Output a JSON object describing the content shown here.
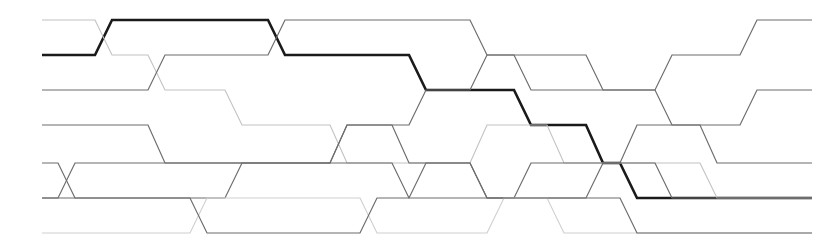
{
  "figure": {
    "name": "braid-diagram",
    "width": 827,
    "height": 250,
    "background_color": "#ffffff"
  },
  "geometry": {
    "lane_y": [
      20,
      55,
      90,
      125,
      163,
      198,
      233
    ],
    "lane_count": 7,
    "x_start": 42,
    "x_end": 812,
    "transition_width": 16,
    "note": "Strands run horizontally along lanes and cross diagonally between adjacent lanes."
  },
  "styles": {
    "thin_color": "#6d6d6d",
    "thin_faint_color": "#b9b9b9",
    "thin_pale_color": "#d8d8d8",
    "bold_color": "#1a1a1a",
    "thin_width": 1.2,
    "thin_faint_width": 1.1,
    "bold_width": 2.6
  },
  "strands": [
    {
      "id": "strand-bold-1",
      "label": "highlighted-strand",
      "emphasis": "bold",
      "color": "#1a1a1a",
      "stroke_width": 2.6,
      "path": [
        {
          "x": 42,
          "lane": 1
        },
        {
          "x": 95,
          "lane": 1
        },
        {
          "x": 112,
          "lane": 0
        },
        {
          "x": 268,
          "lane": 0
        },
        {
          "x": 285,
          "lane": 1
        },
        {
          "x": 409,
          "lane": 1
        },
        {
          "x": 426,
          "lane": 2
        },
        {
          "x": 514,
          "lane": 2
        },
        {
          "x": 531,
          "lane": 3
        },
        {
          "x": 586,
          "lane": 3
        },
        {
          "x": 603,
          "lane": 4
        },
        {
          "x": 620,
          "lane": 4
        },
        {
          "x": 637,
          "lane": 5
        },
        {
          "x": 812,
          "lane": 5
        }
      ]
    },
    {
      "id": "strand-2",
      "label": "strand-lane0-start",
      "emphasis": "faint",
      "color": "#c2c2c2",
      "stroke_width": 1.1,
      "path": [
        {
          "x": 42,
          "lane": 0
        },
        {
          "x": 95,
          "lane": 0
        },
        {
          "x": 112,
          "lane": 1
        },
        {
          "x": 148,
          "lane": 1
        },
        {
          "x": 165,
          "lane": 2
        },
        {
          "x": 225,
          "lane": 2
        },
        {
          "x": 242,
          "lane": 3
        },
        {
          "x": 330,
          "lane": 3
        },
        {
          "x": 347,
          "lane": 4
        },
        {
          "x": 470,
          "lane": 4
        },
        {
          "x": 487,
          "lane": 3
        },
        {
          "x": 547,
          "lane": 3
        },
        {
          "x": 564,
          "lane": 4
        },
        {
          "x": 700,
          "lane": 4
        },
        {
          "x": 717,
          "lane": 5
        },
        {
          "x": 812,
          "lane": 5
        }
      ]
    },
    {
      "id": "strand-3",
      "label": "strand-rising-midline",
      "emphasis": "normal",
      "color": "#6d6d6d",
      "stroke_width": 1.2,
      "path": [
        {
          "x": 42,
          "lane": 2
        },
        {
          "x": 148,
          "lane": 2
        },
        {
          "x": 165,
          "lane": 1
        },
        {
          "x": 268,
          "lane": 1
        },
        {
          "x": 285,
          "lane": 0
        },
        {
          "x": 470,
          "lane": 0
        },
        {
          "x": 487,
          "lane": 1
        },
        {
          "x": 514,
          "lane": 1
        },
        {
          "x": 531,
          "lane": 2
        },
        {
          "x": 655,
          "lane": 2
        },
        {
          "x": 672,
          "lane": 1
        },
        {
          "x": 740,
          "lane": 1
        },
        {
          "x": 757,
          "lane": 0
        },
        {
          "x": 812,
          "lane": 0
        }
      ]
    },
    {
      "id": "strand-4",
      "label": "strand-lane3-weave",
      "emphasis": "normal",
      "color": "#6d6d6d",
      "stroke_width": 1.2,
      "path": [
        {
          "x": 42,
          "lane": 3
        },
        {
          "x": 148,
          "lane": 3
        },
        {
          "x": 165,
          "lane": 4
        },
        {
          "x": 330,
          "lane": 4
        },
        {
          "x": 347,
          "lane": 3
        },
        {
          "x": 409,
          "lane": 3
        },
        {
          "x": 426,
          "lane": 2
        },
        {
          "x": 470,
          "lane": 2
        },
        {
          "x": 487,
          "lane": 1
        },
        {
          "x": 586,
          "lane": 1
        },
        {
          "x": 603,
          "lane": 2
        },
        {
          "x": 655,
          "lane": 2
        },
        {
          "x": 672,
          "lane": 3
        },
        {
          "x": 700,
          "lane": 3
        },
        {
          "x": 717,
          "lane": 4
        },
        {
          "x": 812,
          "lane": 4
        }
      ]
    },
    {
      "id": "strand-5",
      "label": "strand-lane4-crossover",
      "emphasis": "normal",
      "color": "#6d6d6d",
      "stroke_width": 1.2,
      "path": [
        {
          "x": 42,
          "lane": 4
        },
        {
          "x": 58,
          "lane": 4
        },
        {
          "x": 75,
          "lane": 5
        },
        {
          "x": 225,
          "lane": 5
        },
        {
          "x": 242,
          "lane": 4
        },
        {
          "x": 392,
          "lane": 4
        },
        {
          "x": 409,
          "lane": 5
        },
        {
          "x": 586,
          "lane": 5
        },
        {
          "x": 603,
          "lane": 4
        },
        {
          "x": 620,
          "lane": 4
        },
        {
          "x": 637,
          "lane": 3
        },
        {
          "x": 740,
          "lane": 3
        },
        {
          "x": 757,
          "lane": 2
        },
        {
          "x": 812,
          "lane": 2
        }
      ]
    },
    {
      "id": "strand-6",
      "label": "strand-lane5-crossover",
      "emphasis": "normal",
      "color": "#6d6d6d",
      "stroke_width": 1.2,
      "path": [
        {
          "x": 42,
          "lane": 5
        },
        {
          "x": 58,
          "lane": 5
        },
        {
          "x": 75,
          "lane": 4
        },
        {
          "x": 330,
          "lane": 4
        },
        {
          "x": 347,
          "lane": 3
        },
        {
          "x": 392,
          "lane": 3
        },
        {
          "x": 409,
          "lane": 4
        },
        {
          "x": 470,
          "lane": 4
        },
        {
          "x": 487,
          "lane": 5
        },
        {
          "x": 514,
          "lane": 5
        },
        {
          "x": 531,
          "lane": 4
        },
        {
          "x": 655,
          "lane": 4
        },
        {
          "x": 672,
          "lane": 5
        },
        {
          "x": 812,
          "lane": 5
        }
      ]
    },
    {
      "id": "strand-7",
      "label": "strand-bottom-lane",
      "emphasis": "pale",
      "color": "#cfcfcf",
      "stroke_width": 1.1,
      "path": [
        {
          "x": 42,
          "lane": 6
        },
        {
          "x": 190,
          "lane": 6
        },
        {
          "x": 207,
          "lane": 5
        },
        {
          "x": 360,
          "lane": 5
        },
        {
          "x": 377,
          "lane": 6
        },
        {
          "x": 487,
          "lane": 6
        },
        {
          "x": 504,
          "lane": 5
        },
        {
          "x": 547,
          "lane": 5
        },
        {
          "x": 564,
          "lane": 6
        },
        {
          "x": 812,
          "lane": 6
        }
      ]
    },
    {
      "id": "strand-8",
      "label": "strand-lower-weave",
      "emphasis": "normal",
      "color": "#6d6d6d",
      "stroke_width": 1.2,
      "path": [
        {
          "x": 42,
          "lane": 5
        },
        {
          "x": 190,
          "lane": 5
        },
        {
          "x": 207,
          "lane": 6
        },
        {
          "x": 360,
          "lane": 6
        },
        {
          "x": 377,
          "lane": 5
        },
        {
          "x": 409,
          "lane": 5
        },
        {
          "x": 426,
          "lane": 4
        },
        {
          "x": 470,
          "lane": 4
        },
        {
          "x": 487,
          "lane": 5
        },
        {
          "x": 620,
          "lane": 5
        },
        {
          "x": 637,
          "lane": 6
        },
        {
          "x": 812,
          "lane": 6
        }
      ]
    }
  ],
  "crossings": [
    {
      "x": 104,
      "lanes": [
        0,
        1
      ]
    },
    {
      "x": 157,
      "lanes": [
        1,
        2
      ]
    },
    {
      "x": 67,
      "lanes": [
        4,
        5
      ]
    },
    {
      "x": 199,
      "lanes": [
        5,
        6
      ]
    },
    {
      "x": 234,
      "lanes": [
        2,
        3
      ]
    },
    {
      "x": 277,
      "lanes": [
        0,
        1
      ]
    },
    {
      "x": 339,
      "lanes": [
        3,
        4
      ]
    },
    {
      "x": 369,
      "lanes": [
        5,
        6
      ]
    },
    {
      "x": 401,
      "lanes": [
        4,
        5
      ]
    },
    {
      "x": 418,
      "lanes": [
        1,
        2
      ]
    },
    {
      "x": 479,
      "lanes": [
        0,
        1
      ]
    },
    {
      "x": 523,
      "lanes": [
        2,
        3
      ]
    },
    {
      "x": 556,
      "lanes": [
        3,
        4
      ]
    },
    {
      "x": 595,
      "lanes": [
        3,
        4
      ]
    },
    {
      "x": 629,
      "lanes": [
        4,
        5
      ]
    },
    {
      "x": 664,
      "lanes": [
        1,
        2
      ]
    },
    {
      "x": 709,
      "lanes": [
        3,
        4
      ]
    },
    {
      "x": 749,
      "lanes": [
        0,
        1
      ]
    }
  ]
}
